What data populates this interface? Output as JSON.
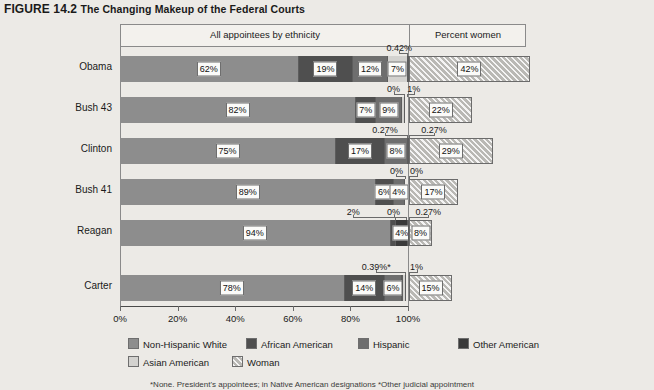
{
  "title": {
    "figure_number": "FIGURE 14.2",
    "text": "The Changing Makeup of the Federal Courts"
  },
  "bands": {
    "ethnicity": "All appointees by ethnicity",
    "women": "Percent women"
  },
  "axis": {
    "ticks": [
      "0%",
      "20%",
      "40%",
      "60%",
      "80%",
      "100%"
    ],
    "tick_values": [
      0,
      20,
      40,
      60,
      80,
      100
    ]
  },
  "legend": {
    "row1": [
      {
        "key": "white",
        "label": "Non-Hispanic White",
        "color": "#8d8d8d"
      },
      {
        "key": "african",
        "label": "African American",
        "color": "#4f4f4f"
      },
      {
        "key": "hisp",
        "label": "Hispanic",
        "color": "#6e6e6e"
      },
      {
        "key": "other",
        "label": "Other American",
        "color": "#3a3a3a"
      }
    ],
    "row2": [
      {
        "key": "asian",
        "label": "Asian American",
        "color": "#d3d2cf"
      },
      {
        "key": "woman",
        "label": "Woman",
        "color": "#b9b8b4"
      }
    ]
  },
  "footnote": "*Nonе. President's appointees; in Native American designations *Other judicial appointment",
  "chart_data": {
    "type": "bar",
    "orientation": "horizontal",
    "stacked": true,
    "title": "The Changing Makeup of the Federal Courts",
    "xlabel": "",
    "ylabel": "",
    "xlim": [
      0,
      100
    ],
    "grid": false,
    "categories": [
      "Obama",
      "Bush 43",
      "Clinton",
      "Bush 41",
      "Reagan",
      "Carter"
    ],
    "series": [
      {
        "name": "Non-Hispanic White",
        "values": [
          62,
          82,
          75,
          89,
          94,
          78
        ]
      },
      {
        "name": "African American",
        "values": [
          19,
          7,
          17,
          6,
          4,
          14
        ]
      },
      {
        "name": "Hispanic",
        "values": [
          12,
          9,
          8,
          4,
          0,
          6
        ]
      },
      {
        "name": "Asian American",
        "values": [
          7,
          1,
          0.27,
          0,
          0.27,
          1
        ]
      },
      {
        "name": "Other American",
        "values": [
          0.42,
          0,
          0.27,
          0,
          2,
          0.39
        ]
      }
    ],
    "women_series": {
      "name": "Woman",
      "values": [
        42,
        22,
        29,
        17,
        8,
        15
      ]
    },
    "rows": [
      {
        "name": "Obama",
        "segments": [
          {
            "key": "white",
            "label": "62%",
            "value": 62,
            "show": "inside"
          },
          {
            "key": "african",
            "label": "19%",
            "value": 19,
            "show": "inside"
          },
          {
            "key": "hisp",
            "label": "12%",
            "value": 12,
            "show": "inside"
          },
          {
            "key": "asian",
            "label": "7%",
            "value": 7,
            "show": "inside"
          },
          {
            "key": "other",
            "label": "0.42%",
            "value": 0.42,
            "show": "callout"
          }
        ],
        "woman": {
          "label": "42%",
          "value": 42
        },
        "callouts": [
          {
            "label": "0.42%",
            "at": 99.8,
            "tx": 97
          }
        ]
      },
      {
        "name": "Bush 43",
        "segments": [
          {
            "key": "white",
            "label": "82%",
            "value": 82,
            "show": "inside"
          },
          {
            "key": "african",
            "label": "7%",
            "value": 7,
            "show": "inside"
          },
          {
            "key": "hisp",
            "label": "9%",
            "value": 9,
            "show": "inside"
          },
          {
            "key": "asian",
            "label": "1%",
            "value": 1,
            "show": "callout"
          },
          {
            "key": "other",
            "label": "0%",
            "value": 0,
            "show": "callout"
          }
        ],
        "woman": {
          "label": "22%",
          "value": 22
        },
        "callouts": [
          {
            "label": "0%",
            "at": 98.5,
            "tx": 95
          },
          {
            "label": "1%",
            "at": 99.6,
            "tx": 102
          }
        ]
      },
      {
        "name": "Clinton",
        "segments": [
          {
            "key": "white",
            "label": "75%",
            "value": 75,
            "show": "inside"
          },
          {
            "key": "african",
            "label": "17%",
            "value": 17,
            "show": "inside"
          },
          {
            "key": "hisp",
            "label": "8%",
            "value": 8,
            "show": "inside"
          },
          {
            "key": "asian",
            "label": "0.27%",
            "value": 0.27,
            "show": "callout"
          },
          {
            "key": "other",
            "label": "0.27%",
            "value": 0.27,
            "show": "callout"
          }
        ],
        "woman": {
          "label": "29%",
          "value": 29
        },
        "callouts": [
          {
            "label": "0.27%",
            "at": 99.7,
            "tx": 92
          },
          {
            "label": "0.27%",
            "at": 100.2,
            "tx": 109
          }
        ]
      },
      {
        "name": "Bush 41",
        "segments": [
          {
            "key": "white",
            "label": "89%",
            "value": 89,
            "show": "inside"
          },
          {
            "key": "african",
            "label": "6%",
            "value": 6,
            "show": "inside"
          },
          {
            "key": "hisp",
            "label": "4%",
            "value": 4,
            "show": "inside"
          },
          {
            "key": "asian",
            "label": "0%",
            "value": 0,
            "show": "callout"
          },
          {
            "key": "other",
            "label": "0%",
            "value": 0,
            "show": "callout"
          }
        ],
        "woman": {
          "label": "17%",
          "value": 17
        },
        "callouts": [
          {
            "label": "0%",
            "at": 99.0,
            "tx": 96
          },
          {
            "label": "0%",
            "at": 100.2,
            "tx": 103
          }
        ]
      },
      {
        "name": "Reagan",
        "segments": [
          {
            "key": "white",
            "label": "94%",
            "value": 94,
            "show": "inside"
          },
          {
            "key": "african",
            "label": "2%",
            "value": 2,
            "show": "callout"
          },
          {
            "key": "hisp",
            "label": "0%",
            "value": 0,
            "show": "callout"
          },
          {
            "key": "other",
            "label": "4%",
            "value": 4,
            "show": "inside"
          },
          {
            "key": "asian",
            "label": "0.27%",
            "value": 0.27,
            "show": "callout"
          }
        ],
        "woman": {
          "label": "8%",
          "value": 8
        },
        "callouts": [
          {
            "label": "2%",
            "at": 95.5,
            "tx": 81
          },
          {
            "label": "0%",
            "at": 99.3,
            "tx": 95
          },
          {
            "label": "0.27%",
            "at": 100.3,
            "tx": 107
          }
        ]
      },
      {
        "name": "Carter",
        "segments": [
          {
            "key": "white",
            "label": "78%",
            "value": 78,
            "show": "inside"
          },
          {
            "key": "african",
            "label": "14%",
            "value": 14,
            "show": "inside"
          },
          {
            "key": "hisp",
            "label": "6%",
            "value": 6,
            "show": "inside"
          },
          {
            "key": "other",
            "label": "0.39%*",
            "value": 0.39,
            "show": "callout"
          },
          {
            "key": "asian",
            "label": "1%",
            "value": 1,
            "show": "callout"
          }
        ],
        "woman": {
          "label": "15%",
          "value": 15
        },
        "callouts": [
          {
            "label": "0.39%*",
            "at": 99.0,
            "tx": 89
          },
          {
            "label": "1%",
            "at": 100.2,
            "tx": 103
          }
        ]
      }
    ]
  }
}
